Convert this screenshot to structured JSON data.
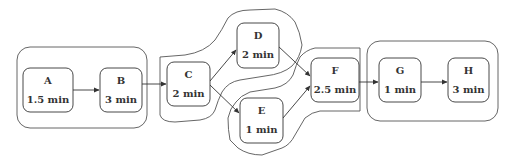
{
  "diagram": {
    "type": "process-flow",
    "nodes": [
      {
        "id": "A",
        "label": "A",
        "duration": "1.5 min",
        "x": 23,
        "y": 68,
        "w": 50,
        "h": 44
      },
      {
        "id": "B",
        "label": "B",
        "duration": "3 min",
        "x": 100,
        "y": 68,
        "w": 42,
        "h": 44
      },
      {
        "id": "C",
        "label": "C",
        "duration": "2 min",
        "x": 167,
        "y": 62,
        "w": 43,
        "h": 44
      },
      {
        "id": "D",
        "label": "D",
        "duration": "2 min",
        "x": 237,
        "y": 23,
        "w": 42,
        "h": 45
      },
      {
        "id": "E",
        "label": "E",
        "duration": "1 min",
        "x": 240,
        "y": 98,
        "w": 43,
        "h": 45
      },
      {
        "id": "F",
        "label": "F",
        "duration": "2.5 min",
        "x": 311,
        "y": 58,
        "w": 48,
        "h": 44
      },
      {
        "id": "G",
        "label": "G",
        "duration": "1 min",
        "x": 379,
        "y": 58,
        "w": 42,
        "h": 44
      },
      {
        "id": "H",
        "label": "H",
        "duration": "3 min",
        "x": 448,
        "y": 58,
        "w": 41,
        "h": 44
      }
    ],
    "edges": [
      {
        "from": "A",
        "to": "B"
      },
      {
        "from": "B",
        "to": "C"
      },
      {
        "from": "C",
        "to": "D"
      },
      {
        "from": "C",
        "to": "E"
      },
      {
        "from": "D",
        "to": "F"
      },
      {
        "from": "E",
        "to": "F"
      },
      {
        "from": "F",
        "to": "G"
      },
      {
        "from": "G",
        "to": "H"
      }
    ],
    "groups": [
      {
        "id": "group-1",
        "members": [
          "A",
          "B"
        ],
        "shape": "rounded-rect"
      },
      {
        "id": "group-2",
        "members": [
          "C",
          "D"
        ],
        "shape": "freeform"
      },
      {
        "id": "group-3",
        "members": [
          "E",
          "F"
        ],
        "shape": "freeform"
      },
      {
        "id": "group-4",
        "members": [
          "G",
          "H"
        ],
        "shape": "rounded-rect"
      }
    ],
    "colors": {
      "stroke": "#333333",
      "group_stroke": "#555555",
      "background": "#ffffff"
    }
  }
}
